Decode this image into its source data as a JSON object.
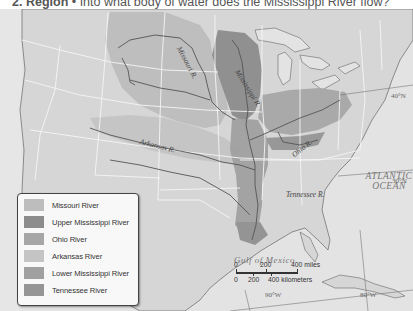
{
  "question": {
    "number": "2.",
    "category": "Region",
    "separator": "•",
    "text": "Into what body of water does the Mississippi River flow?"
  },
  "map": {
    "rivers": [
      {
        "name": "Missouri R.",
        "label": "Missouri R."
      },
      {
        "name": "Mississippi R.",
        "label": "Mississippi R."
      },
      {
        "name": "Arkansas R.",
        "label": "Arkansas R."
      },
      {
        "name": "Ohio R.",
        "label": "Ohio R."
      },
      {
        "name": "Tennessee R.",
        "label": "Tennessee R."
      }
    ],
    "water_bodies": {
      "atlantic_line1": "ATLANTIC",
      "atlantic_line2": "OCEAN",
      "gulf": "Gulf of Mexico"
    },
    "coordinates": {
      "lat_40": "40°N",
      "lat_30": "30°N",
      "lon_90": "90°W",
      "lon_80": "80°W"
    },
    "scale": {
      "miles_0": "0",
      "miles_200": "200",
      "miles_400": "400 miles",
      "km_0": "0",
      "km_200": "200",
      "km_400": "400 kilometers"
    },
    "colors": {
      "land": "#dcdcdc",
      "ocean": "#e4e4e4",
      "borders": "#f4f4f4",
      "rivers": "#555555"
    }
  },
  "legend": {
    "items": [
      {
        "label": "Missouri River",
        "color": "#bdbdbd"
      },
      {
        "label": "Upper Mississippi River",
        "color": "#8c8c8c"
      },
      {
        "label": "Ohio River",
        "color": "#a6a6a6"
      },
      {
        "label": "Arkansas River",
        "color": "#c4c4c4"
      },
      {
        "label": "Lower Mississippi River",
        "color": "#a0a0a0"
      },
      {
        "label": "Tennessee River",
        "color": "#959595"
      }
    ]
  }
}
